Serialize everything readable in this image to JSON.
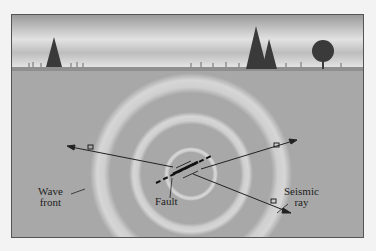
{
  "labels": {
    "wave_front": [
      "Wave",
      "front"
    ],
    "fault": "Fault",
    "seismic_ray": [
      "Seismic",
      "ray"
    ]
  },
  "colors": {
    "sky": "#d9d9d9",
    "ground": "#a6a6a6",
    "wave": "#c8c8c8",
    "line": "#222222"
  }
}
